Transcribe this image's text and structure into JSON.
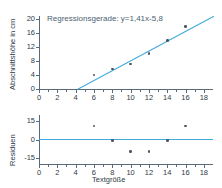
{
  "chart_data": [
    {
      "id": "scatter-regression",
      "type": "scatter",
      "title": "",
      "xlabel": "",
      "ylabel": "Abschnittshöhe in cm",
      "xlim": [
        0,
        19
      ],
      "ylim": [
        0,
        21
      ],
      "xticks": [
        0,
        2,
        4,
        6,
        8,
        10,
        12,
        14,
        16,
        18
      ],
      "xticklabels": [
        "0",
        "2",
        "4",
        "6",
        "8",
        "10",
        "12",
        "14",
        "16",
        "18"
      ],
      "yticks": [
        0,
        4,
        8,
        12,
        16,
        20
      ],
      "yticklabels": [
        "0",
        "4",
        "8",
        "12",
        "16",
        "20"
      ],
      "grid": false,
      "legend": "none",
      "annotation": "Regressionsgerade: y=1,41x-5,8",
      "series": [
        {
          "name": "Messpunkte",
          "marker": "circle",
          "color": "#4a5864",
          "x": [
            6,
            8,
            10,
            12,
            14,
            16
          ],
          "y": [
            4.0,
            5.7,
            7.2,
            10.2,
            14.0,
            18.0
          ]
        }
      ],
      "fit_line": {
        "name": "Regressionsgerade",
        "color": "#3fa9dc",
        "slope": 1.41,
        "intercept": -5.8,
        "equation": "y=1,41x-5,8",
        "x_start": 4.11,
        "x_end": 19.0
      }
    },
    {
      "id": "residual-plot",
      "type": "scatter",
      "title": "",
      "xlabel": "Textgröße",
      "ylabel": "Residuen",
      "xlim": [
        0,
        19
      ],
      "ylim": [
        -20,
        20
      ],
      "xticks": [
        0,
        2,
        4,
        6,
        8,
        10,
        12,
        14,
        16,
        18
      ],
      "xticklabels": [
        "0",
        "2",
        "4",
        "6",
        "8",
        "10",
        "12",
        "14",
        "16",
        "18"
      ],
      "yticks": [
        15,
        0,
        -15
      ],
      "yticklabels": [
        "15",
        "0",
        "-15"
      ],
      "grid": false,
      "legend": "none",
      "zero_line": {
        "value": 0,
        "color": "#3fa9dc"
      },
      "series": [
        {
          "name": "Residuen",
          "marker": "circle",
          "color": "#4a5864",
          "x": [
            6,
            8,
            10,
            12,
            14,
            16
          ],
          "y": [
            11.0,
            -1.0,
            -10.0,
            -10.0,
            -1.0,
            11.0
          ]
        }
      ]
    }
  ]
}
